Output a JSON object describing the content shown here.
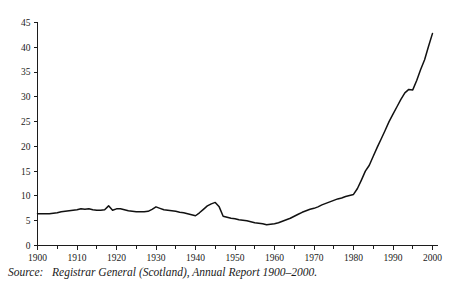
{
  "figure": {
    "background_color": "#ffffff",
    "line_color": "#111111",
    "axis_color": "#1c1c1c"
  },
  "caption": {
    "source_label": "Source:",
    "source_text": "Registrar General (Scotland), Annual Report 1900–2000."
  },
  "chart_data": {
    "type": "line",
    "title": "",
    "subtitle": "",
    "xlabel": "",
    "ylabel": "",
    "xlim": [
      1900,
      2000
    ],
    "ylim": [
      0,
      45
    ],
    "grid": false,
    "legend": null,
    "y_ticks": [
      0,
      5,
      10,
      15,
      20,
      25,
      30,
      35,
      40,
      45
    ],
    "y_tick_labels": [
      "0",
      "5",
      "10",
      "15",
      "20",
      "25",
      "30",
      "35",
      "40",
      "45"
    ],
    "x_ticks": [
      1900,
      1910,
      1920,
      1930,
      1940,
      1950,
      1960,
      1970,
      1980,
      1990,
      2000
    ],
    "x_tick_labels": [
      "1900",
      "1910",
      "1920",
      "1930",
      "1940",
      "1950",
      "1960",
      "1970",
      "1980",
      "1990",
      "2000"
    ],
    "x_minor_ticks": [
      1905,
      1915,
      1925,
      1935,
      1945,
      1955,
      1965,
      1975,
      1985,
      1995
    ],
    "series": [
      {
        "name": "Percentage of births outside marriage (Scotland)",
        "x": [
          1900,
          1901,
          1902,
          1903,
          1904,
          1905,
          1906,
          1907,
          1908,
          1909,
          1910,
          1911,
          1912,
          1913,
          1914,
          1915,
          1916,
          1917,
          1918,
          1919,
          1920,
          1921,
          1922,
          1923,
          1924,
          1925,
          1926,
          1927,
          1928,
          1929,
          1930,
          1931,
          1932,
          1933,
          1934,
          1935,
          1936,
          1937,
          1938,
          1939,
          1940,
          1941,
          1942,
          1943,
          1944,
          1945,
          1946,
          1947,
          1948,
          1949,
          1950,
          1951,
          1952,
          1953,
          1954,
          1955,
          1956,
          1957,
          1958,
          1959,
          1960,
          1961,
          1962,
          1963,
          1964,
          1965,
          1966,
          1967,
          1968,
          1969,
          1970,
          1971,
          1972,
          1973,
          1974,
          1975,
          1976,
          1977,
          1978,
          1979,
          1980,
          1981,
          1982,
          1983,
          1984,
          1985,
          1986,
          1987,
          1988,
          1989,
          1990,
          1991,
          1992,
          1993,
          1994,
          1995,
          1996,
          1997,
          1998,
          1999,
          2000
        ],
        "values": [
          6.4,
          6.4,
          6.4,
          6.4,
          6.5,
          6.6,
          6.8,
          6.9,
          7.0,
          7.1,
          7.2,
          7.4,
          7.3,
          7.4,
          7.2,
          7.1,
          7.1,
          7.2,
          8.0,
          7.1,
          7.4,
          7.4,
          7.2,
          7.0,
          6.9,
          6.8,
          6.8,
          6.8,
          6.9,
          7.3,
          7.8,
          7.5,
          7.2,
          7.1,
          7.0,
          6.9,
          6.7,
          6.6,
          6.4,
          6.2,
          6.0,
          6.6,
          7.3,
          8.0,
          8.4,
          8.7,
          7.8,
          5.9,
          5.7,
          5.5,
          5.4,
          5.2,
          5.1,
          5.0,
          4.8,
          4.6,
          4.5,
          4.4,
          4.2,
          4.3,
          4.4,
          4.6,
          4.9,
          5.2,
          5.5,
          5.9,
          6.3,
          6.7,
          7.0,
          7.3,
          7.5,
          7.8,
          8.2,
          8.5,
          8.8,
          9.1,
          9.4,
          9.6,
          9.9,
          10.1,
          10.3,
          11.5,
          13.2,
          15.0,
          16.2,
          18.0,
          19.8,
          21.5,
          23.2,
          25.0,
          26.5,
          28.0,
          29.5,
          30.8,
          31.5,
          31.4,
          33.3,
          35.5,
          37.5,
          40.2,
          42.8
        ]
      }
    ],
    "annotations": [
      {
        "year": 1918,
        "value": 8.0,
        "note": "First World War peak"
      },
      {
        "year": 1945,
        "value": 8.7,
        "note": "Second World War peak"
      },
      {
        "year": 1958,
        "value": 4.2,
        "note": "Minimum"
      },
      {
        "year": 1994,
        "value": 31.5,
        "note": "Plateau"
      },
      {
        "year": 2000,
        "value": 42.8,
        "note": "Maximum"
      }
    ]
  }
}
